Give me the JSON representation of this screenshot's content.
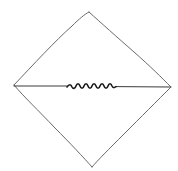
{
  "diagram": {
    "background": "#ffffff",
    "colors": {
      "outline": "#6a6a6a",
      "midline": "#3a3a3a",
      "squiggle": "#1a1a1a"
    },
    "diamond": {
      "top": [
        89,
        12
      ],
      "right": [
        171,
        87
      ],
      "bottom": [
        92,
        167
      ],
      "left": [
        14,
        85
      ]
    },
    "midline": {
      "start": [
        14,
        86
      ],
      "end": [
        170,
        87
      ]
    },
    "squiggle": {
      "x_start": 67,
      "x_end": 116,
      "y": 86,
      "waves": 5,
      "amplitude": 2
    }
  }
}
